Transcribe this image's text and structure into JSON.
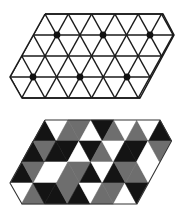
{
  "figure": {
    "width": 187,
    "height": 217,
    "background": "#ffffff"
  },
  "colors": {
    "black": "#141414",
    "gray": "#6e6e6e",
    "white": "#ffffff",
    "line": "#1a1a1a"
  },
  "top_lattice": {
    "description": "Triangular lattice with marked vertices (dots)",
    "edge": 23.3,
    "row_ys": [
      14,
      35,
      56,
      77,
      98
    ],
    "outline": [
      [
        45,
        14
      ],
      [
        163,
        14
      ],
      [
        174,
        35
      ],
      [
        140,
        98
      ],
      [
        22,
        98
      ],
      [
        10,
        77
      ],
      [
        45,
        14
      ]
    ],
    "horizontal_lines": [
      [
        45,
        163,
        14
      ],
      [
        33.5,
        174,
        35
      ],
      [
        22,
        162.5,
        56
      ],
      [
        10,
        151,
        77
      ],
      [
        22,
        140,
        98
      ]
    ],
    "dots": [
      [
        57,
        35
      ],
      [
        103,
        35
      ],
      [
        150,
        35
      ],
      [
        33,
        77
      ],
      [
        80,
        77
      ],
      [
        127,
        77
      ]
    ],
    "dot_radius": 3.4
  },
  "bottom_lattice": {
    "description": "Same lattice region with triangles colored black, gray, white",
    "edge": 23,
    "rows": [
      {
        "y_top": 120,
        "y_bot": 141,
        "triangles": [
          {
            "type": "up",
            "x": 45,
            "c": "black"
          },
          {
            "type": "down",
            "x": 45,
            "c": "white"
          },
          {
            "type": "up",
            "x": 68,
            "c": "gray"
          },
          {
            "type": "down",
            "x": 68,
            "c": "gray"
          },
          {
            "type": "up",
            "x": 91,
            "c": "white"
          },
          {
            "type": "down",
            "x": 91,
            "c": "black"
          },
          {
            "type": "up",
            "x": 114,
            "c": "gray"
          },
          {
            "type": "down",
            "x": 114,
            "c": "white"
          },
          {
            "type": "up",
            "x": 137,
            "c": "gray"
          },
          {
            "type": "down",
            "x": 137,
            "c": "white"
          },
          {
            "type": "up",
            "x": 160,
            "c": "black"
          }
        ]
      },
      {
        "y_top": 141,
        "y_bot": 162,
        "triangles": [
          {
            "type": "up",
            "x": 33,
            "c": "black"
          },
          {
            "type": "down",
            "x": 33,
            "c": "gray"
          },
          {
            "type": "up",
            "x": 56,
            "c": "black"
          },
          {
            "type": "down",
            "x": 56,
            "c": "black"
          },
          {
            "type": "up",
            "x": 79,
            "c": "white"
          },
          {
            "type": "down",
            "x": 79,
            "c": "black"
          },
          {
            "type": "up",
            "x": 102,
            "c": "gray"
          },
          {
            "type": "down",
            "x": 102,
            "c": "white"
          },
          {
            "type": "up",
            "x": 125,
            "c": "black"
          },
          {
            "type": "down",
            "x": 125,
            "c": "black"
          },
          {
            "type": "up",
            "x": 148,
            "c": "white"
          },
          {
            "type": "down",
            "x": 148,
            "c": "gray"
          }
        ]
      },
      {
        "y_top": 162,
        "y_bot": 183,
        "triangles": [
          {
            "type": "up",
            "x": 22,
            "c": "black"
          },
          {
            "type": "down",
            "x": 22,
            "c": "gray"
          },
          {
            "type": "up",
            "x": 45,
            "c": "white"
          },
          {
            "type": "down",
            "x": 45,
            "c": "white"
          },
          {
            "type": "up",
            "x": 68,
            "c": "gray"
          },
          {
            "type": "down",
            "x": 68,
            "c": "gray"
          },
          {
            "type": "up",
            "x": 91,
            "c": "black"
          },
          {
            "type": "down",
            "x": 91,
            "c": "white"
          },
          {
            "type": "up",
            "x": 114,
            "c": "black"
          },
          {
            "type": "down",
            "x": 114,
            "c": "gray"
          },
          {
            "type": "up",
            "x": 137,
            "c": "gray"
          },
          {
            "type": "down",
            "x": 137,
            "c": "white"
          }
        ]
      },
      {
        "y_top": 183,
        "y_bot": 204,
        "triangles": [
          {
            "type": "down",
            "x": 10,
            "c": "white"
          },
          {
            "type": "up",
            "x": 33,
            "c": "gray"
          },
          {
            "type": "down",
            "x": 33,
            "c": "black"
          },
          {
            "type": "up",
            "x": 56,
            "c": "black"
          },
          {
            "type": "down",
            "x": 56,
            "c": "gray"
          },
          {
            "type": "up",
            "x": 79,
            "c": "black"
          },
          {
            "type": "down",
            "x": 79,
            "c": "white"
          },
          {
            "type": "up",
            "x": 102,
            "c": "gray"
          },
          {
            "type": "down",
            "x": 102,
            "c": "gray"
          },
          {
            "type": "up",
            "x": 125,
            "c": "white"
          },
          {
            "type": "down",
            "x": 125,
            "c": "black"
          }
        ]
      }
    ],
    "outline": [
      [
        45,
        120
      ],
      [
        160,
        120
      ],
      [
        171.5,
        141
      ],
      [
        137,
        204
      ],
      [
        22,
        204
      ],
      [
        10,
        183
      ],
      [
        45,
        120
      ]
    ]
  }
}
